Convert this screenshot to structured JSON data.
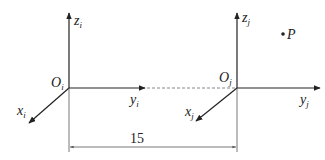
{
  "frame_i": {
    "origin_label": "O",
    "origin_sub": "i",
    "x_label": "x",
    "x_sub": "i",
    "y_label": "y",
    "y_sub": "i",
    "z_label": "z",
    "z_sub": "i"
  },
  "frame_j": {
    "origin_label": "O",
    "origin_sub": "j",
    "x_label": "x",
    "x_sub": "j",
    "y_label": "y",
    "y_sub": "j",
    "z_label": "z",
    "z_sub": "j"
  },
  "point": {
    "label": "P"
  },
  "dimension": {
    "value": "15"
  },
  "colors": {
    "stroke": "#222222",
    "dashed": "#888888",
    "background": "#ffffff"
  }
}
